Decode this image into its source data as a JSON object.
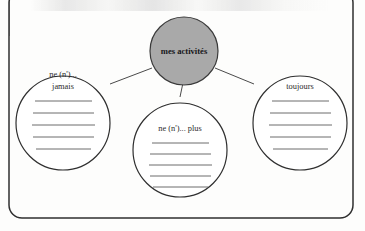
{
  "worksheet": {
    "frame": {
      "shape": "rounded-rectangle"
    },
    "center_node": {
      "label": "mes activités",
      "fill_color": "#a9a9a9",
      "stroke_color": "#3a3a3a",
      "bold": true
    },
    "branches": [
      {
        "id": "jamais",
        "label_lines": [
          "ne (n')...",
          "jamais"
        ],
        "fill_color": "#ffffff",
        "stroke_color": "#3a3a3a",
        "answer_line_count": 5
      },
      {
        "id": "plus",
        "label_lines": [
          "ne (n')... plus"
        ],
        "fill_color": "#ffffff",
        "stroke_color": "#3a3a3a",
        "answer_line_count": 5
      },
      {
        "id": "toujours",
        "label_lines": [
          "toujours"
        ],
        "fill_color": "#ffffff",
        "stroke_color": "#3a3a3a",
        "answer_line_count": 5
      }
    ],
    "connectors": [
      {
        "from": "center_node",
        "to": "jamais"
      },
      {
        "from": "center_node",
        "to": "plus"
      },
      {
        "from": "center_node",
        "to": "toujours"
      }
    ]
  }
}
